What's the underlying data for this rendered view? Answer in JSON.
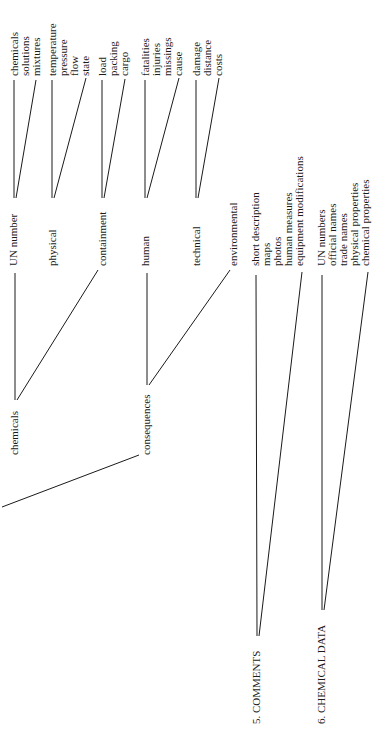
{
  "diagram": {
    "orientation": "rotated -90deg (text reads bottom-to-top)",
    "sections": [
      {
        "label": "chemicals",
        "children": [
          {
            "label": "UN number",
            "leaves": [
              "chemicals",
              "solutions",
              "mixtures"
            ]
          },
          {
            "label": "physical",
            "leaves": [
              "temperature",
              "pressure",
              "flow",
              "state"
            ]
          },
          {
            "label": "containment",
            "leaves": [
              "load",
              "packing",
              "cargo"
            ]
          }
        ]
      },
      {
        "label": "consequences",
        "children": [
          {
            "label": "human",
            "leaves": [
              "fatalities",
              "injuries",
              "missings",
              "cause"
            ]
          },
          {
            "label": "technical",
            "leaves": [
              "damage",
              "distance",
              "costs"
            ]
          },
          {
            "label": "environmental",
            "leaves": []
          }
        ]
      },
      {
        "label": "5. COMMENTS",
        "leaves": [
          "short description",
          "maps",
          "photos",
          "human measures",
          "equipment modifications"
        ]
      },
      {
        "label": "6. CHEMICAL DATA",
        "leaves": [
          "UN numbers",
          "official names",
          "trade names",
          "physical properties",
          "chemical properties"
        ]
      }
    ]
  },
  "labels": {
    "un_chemicals": "chemicals",
    "un_solutions": "solutions",
    "un_mixtures": "mixtures",
    "ph_temperature": "temperature",
    "ph_pressure": "pressure",
    "ph_flow": "flow",
    "ph_state": "state",
    "co_load": "load",
    "co_packing": "packing",
    "co_cargo": "cargo",
    "hu_fatalities": "fatalities",
    "hu_injuries": "injuries",
    "hu_missings": "missings",
    "hu_cause": "cause",
    "te_damage": "damage",
    "te_distance": "distance",
    "te_costs": "costs",
    "un_number": "UN number",
    "physical": "physical",
    "containment": "containment",
    "human": "human",
    "technical": "technical",
    "environmental": "environmental",
    "chemicals": "chemicals",
    "consequences": "consequences",
    "cm_short": "short description",
    "cm_maps": "maps",
    "cm_photos": "photos",
    "cm_human": "human measures",
    "cm_equipment": "equipment modifications",
    "cd_un": "UN numbers",
    "cd_official": "official names",
    "cd_trade": "trade names",
    "cd_physical": "physical properties",
    "cd_chemical": "chemical properties",
    "comments": "5. COMMENTS",
    "chemical_data": "6. CHEMICAL DATA"
  }
}
